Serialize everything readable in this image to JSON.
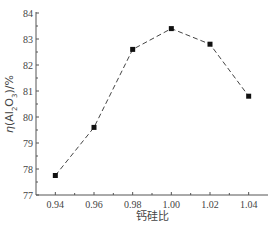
{
  "chart_data": {
    "type": "line",
    "title": "",
    "xlabel": "钙硅比",
    "ylabel": "η(Al2O3)/%",
    "x": [
      0.94,
      0.96,
      0.98,
      1.0,
      1.02,
      1.04
    ],
    "series": [
      {
        "name": "η(Al2O3)",
        "values": [
          77.75,
          79.6,
          82.6,
          83.4,
          82.8,
          80.8
        ]
      }
    ],
    "xlim": [
      0.93,
      1.05
    ],
    "ylim": [
      77,
      84
    ],
    "xticks": [
      "0.94",
      "0.96",
      "0.98",
      "1.00",
      "1.02",
      "1.04"
    ],
    "yticks": [
      "77",
      "78",
      "79",
      "80",
      "81",
      "82",
      "83",
      "84"
    ],
    "grid": false,
    "line_style": "dashed",
    "marker": "square"
  }
}
